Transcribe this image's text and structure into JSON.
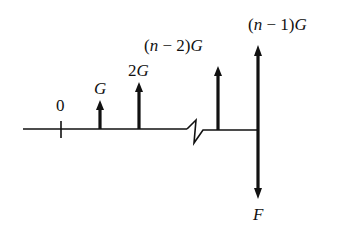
{
  "diagram": {
    "axis": {
      "origin_label": "0"
    },
    "flows": [
      {
        "label_parts": [
          "",
          "G"
        ],
        "direction": "up"
      },
      {
        "label_parts": [
          "2",
          "G"
        ],
        "direction": "up"
      },
      {
        "label_parts": [
          "(",
          "n",
          " − 2)",
          "G"
        ],
        "direction": "up"
      },
      {
        "label_parts": [
          "(",
          "n",
          " − 1)",
          "G"
        ],
        "direction": "up"
      },
      {
        "label_parts": [
          "F"
        ],
        "direction": "down"
      }
    ],
    "colors": {
      "ink": "#111111",
      "background": "#ffffff"
    }
  }
}
